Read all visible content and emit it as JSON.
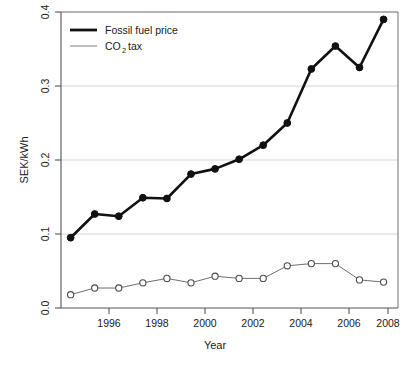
{
  "chart_data": {
    "type": "line",
    "title": "",
    "xlabel": "Year",
    "ylabel": "SEK/kWh",
    "x": [
      1995,
      1996,
      1997,
      1998,
      1999,
      2000,
      2001,
      2002,
      2003,
      2004,
      2005,
      2006,
      2007,
      2008
    ],
    "xlim": [
      1994.6,
      2008.6
    ],
    "ylim": [
      0.0,
      0.4
    ],
    "xticks": [
      1996,
      1998,
      2000,
      2002,
      2004,
      2006,
      2008
    ],
    "xtick_labels": [
      "1996",
      "1998",
      "2000",
      "2002",
      "2004",
      "2006",
      "2008"
    ],
    "yticks": [
      0.0,
      0.1,
      0.2,
      0.3,
      0.4
    ],
    "ytick_labels": [
      "0.0",
      "0.1",
      "0.2",
      "0.3",
      "0.4"
    ],
    "grid": "horizontal",
    "legend_position": "top-left",
    "series": [
      {
        "name": "Fossil fuel price",
        "marker": "filled-circle",
        "color": "#111111",
        "line_width": "thick",
        "values": [
          0.095,
          0.127,
          0.124,
          0.149,
          0.148,
          0.181,
          0.188,
          0.201,
          0.22,
          0.25,
          0.323,
          0.354,
          0.325,
          0.39
        ]
      },
      {
        "name": "CO2 tax",
        "name_rich": {
          "prefix": "CO",
          "subscript": "2",
          "suffix": " tax"
        },
        "marker": "open-circle",
        "color": "#6f6f6f",
        "line_width": "thin",
        "values": [
          0.018,
          0.027,
          0.027,
          0.034,
          0.04,
          0.034,
          0.043,
          0.04,
          0.04,
          0.057,
          0.06,
          0.06,
          0.038,
          0.035
        ]
      }
    ]
  },
  "legend": {
    "entry_fossil": "Fossil fuel price",
    "entry_tax_prefix": "CO",
    "entry_tax_sub": "2",
    "entry_tax_suffix": "tax"
  },
  "axes": {
    "y_title": "SEK/kWh",
    "x_title": "Year"
  }
}
